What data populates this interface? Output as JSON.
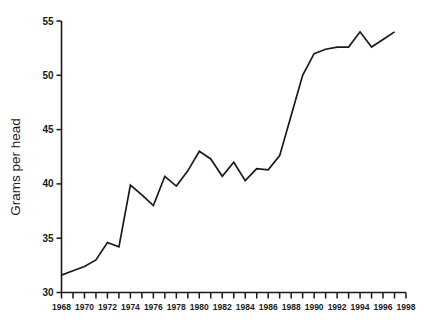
{
  "chart_data": {
    "type": "line",
    "title": "",
    "xlabel": "",
    "ylabel": "Grams per head",
    "xlim": [
      1968,
      1998
    ],
    "ylim": [
      30,
      55
    ],
    "grid": false,
    "legend": null,
    "y_ticks": [
      30,
      35,
      40,
      45,
      50,
      55
    ],
    "y_tick_labels": [
      "30",
      "35",
      "40",
      "45",
      "50",
      "55"
    ],
    "x_ticks": [
      1968,
      1969,
      1970,
      1971,
      1972,
      1973,
      1974,
      1975,
      1976,
      1977,
      1978,
      1979,
      1980,
      1981,
      1982,
      1983,
      1984,
      1985,
      1986,
      1987,
      1988,
      1989,
      1990,
      1991,
      1992,
      1993,
      1994,
      1995,
      1996,
      1997,
      1998
    ],
    "x_tick_labels": [
      "1968",
      "1970",
      "1972",
      "1974",
      "1976",
      "1978",
      "1980",
      "1982",
      "1984",
      "1986",
      "1988",
      "1990",
      "1992",
      "1994",
      "1996",
      "1998"
    ],
    "x_labeled_ticks": [
      1968,
      1970,
      1972,
      1974,
      1976,
      1978,
      1980,
      1982,
      1984,
      1986,
      1988,
      1990,
      1992,
      1994,
      1996,
      1998
    ],
    "x": [
      1968,
      1969,
      1970,
      1971,
      1972,
      1973,
      1974,
      1975,
      1976,
      1977,
      1978,
      1979,
      1980,
      1981,
      1982,
      1983,
      1984,
      1985,
      1986,
      1987,
      1988,
      1989,
      1990,
      1991,
      1992,
      1993,
      1994,
      1995,
      1996,
      1997
    ],
    "values": [
      31.6,
      32.0,
      32.4,
      33.0,
      34.6,
      34.2,
      39.9,
      39.0,
      38.0,
      40.7,
      39.8,
      41.2,
      43.0,
      42.3,
      40.7,
      42.0,
      40.3,
      41.4,
      41.3,
      42.6,
      46.3,
      50.0,
      52.0,
      52.4,
      52.6,
      52.6,
      54.0,
      52.6,
      53.3,
      54.0
    ],
    "series_name": "Grams per head",
    "line_color": "#1a1a1a",
    "background_color": "#ffffff"
  },
  "axes": {
    "y_axis_title": "Grams per head"
  }
}
